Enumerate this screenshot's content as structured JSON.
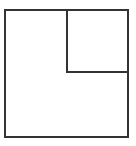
{
  "diagram": {
    "stroke_color": "#333333",
    "background_color": "#ffffff",
    "shapes": [
      {
        "name": "outer-square",
        "x": 5,
        "y": 10,
        "width": 123,
        "height": 127
      },
      {
        "name": "inner-square-top-right",
        "x": 67,
        "y": 10,
        "width": 61,
        "height": 62
      }
    ]
  }
}
